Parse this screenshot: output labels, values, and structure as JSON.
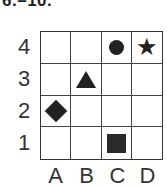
{
  "title": "6.–10.",
  "grid": {
    "rows": [
      "4",
      "3",
      "2",
      "1"
    ],
    "columns": [
      "A",
      "B",
      "C",
      "D"
    ],
    "cells": [
      [
        "",
        "",
        "circle",
        "star"
      ],
      [
        "",
        "triangle",
        "",
        ""
      ],
      [
        "diamond",
        "",
        "",
        ""
      ],
      [
        "",
        "",
        "square",
        ""
      ]
    ]
  },
  "shapes": [
    {
      "shape": "circle",
      "position": "C4"
    },
    {
      "shape": "star",
      "position": "D4",
      "glyph": "★"
    },
    {
      "shape": "triangle",
      "position": "B3"
    },
    {
      "shape": "diamond",
      "position": "A2"
    },
    {
      "shape": "square",
      "position": "C1"
    }
  ]
}
